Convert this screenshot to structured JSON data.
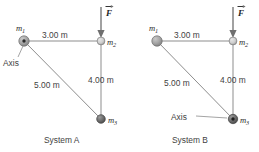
{
  "figure": {
    "background_color": "#ffffff",
    "rod_color": "#8d8d8d",
    "force_color": "#6f6f6f",
    "text_color": "#3f3f3f"
  },
  "labels": {
    "m1": "m",
    "m1_sub": "1",
    "m2": "m",
    "m2_sub": "2",
    "m3": "m",
    "m3_sub": "3",
    "force": "F",
    "axis": "Axis",
    "dim_top": "3.00 m",
    "dim_right": "4.00 m",
    "dim_hyp": "5.00 m"
  },
  "systems": [
    {
      "id": "system-a",
      "caption": "System A",
      "axis_at": "m1",
      "masses": [
        {
          "name": "m1",
          "label": "m",
          "sub": "1",
          "x": 0.0,
          "y": 0.0,
          "style": "sphere-axis",
          "radius": 5.2
        },
        {
          "name": "m2",
          "label": "m",
          "sub": "2",
          "x": 3.0,
          "y": 0.0,
          "style": "sphere-light",
          "radius": 3.8
        },
        {
          "name": "m3",
          "label": "m",
          "sub": "3",
          "x": 3.0,
          "y": -4.0,
          "style": "sphere-dark",
          "radius": 4.2
        }
      ],
      "rods": [
        {
          "from": "m1",
          "to": "m2",
          "length_label": "3.00 m"
        },
        {
          "from": "m2",
          "to": "m3",
          "length_label": "4.00 m"
        },
        {
          "from": "m1",
          "to": "m3",
          "length_label": "5.00 m"
        }
      ],
      "force": {
        "on": "m2",
        "label": "F",
        "direction": "down",
        "vector": true
      },
      "axis_label": {
        "text": "Axis",
        "leader": false
      }
    },
    {
      "id": "system-b",
      "caption": "System B",
      "axis_at": "m3",
      "masses": [
        {
          "name": "m1",
          "label": "m",
          "sub": "1",
          "x": 0.0,
          "y": 0.0,
          "style": "sphere-gray",
          "radius": 5.2
        },
        {
          "name": "m2",
          "label": "m",
          "sub": "2",
          "x": 3.0,
          "y": 0.0,
          "style": "sphere-light",
          "radius": 3.8
        },
        {
          "name": "m3",
          "label": "m",
          "sub": "3",
          "x": 3.0,
          "y": -4.0,
          "style": "sphere-axis-dark",
          "radius": 4.6
        }
      ],
      "rods": [
        {
          "from": "m1",
          "to": "m2",
          "length_label": "3.00 m"
        },
        {
          "from": "m2",
          "to": "m3",
          "length_label": "4.00 m"
        },
        {
          "from": "m1",
          "to": "m3",
          "length_label": "5.00 m"
        }
      ],
      "force": {
        "on": "m2",
        "label": "F",
        "direction": "down",
        "vector": true
      },
      "axis_label": {
        "text": "Axis",
        "leader": true
      }
    }
  ],
  "geometry": {
    "triangle": {
      "base_m": 3.0,
      "height_m": 4.0,
      "hypotenuse_m": 5.0,
      "right_angle_at": "m2"
    }
  }
}
